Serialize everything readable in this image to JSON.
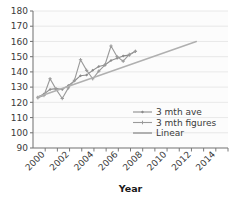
{
  "chart_data": {
    "type": "line",
    "title": "",
    "xlabel": "Year",
    "ylabel": "",
    "xlim": [
      1999,
      2015
    ],
    "ylim": [
      90,
      180
    ],
    "ytick_step": 10,
    "xtick_step": 2,
    "grid": true,
    "legend_position": "inside-right",
    "xticks": [
      "2000",
      "2002",
      "2004",
      "2006",
      "2008",
      "2010",
      "2012",
      "2014"
    ],
    "xtick_values": [
      2000,
      2002,
      2004,
      2006,
      2008,
      2010,
      2012,
      2014
    ],
    "yticks": [
      "90",
      "100",
      "110",
      "120",
      "130",
      "140",
      "150",
      "160",
      "170",
      "180"
    ],
    "ytick_values": [
      90,
      100,
      110,
      120,
      130,
      140,
      150,
      160,
      170,
      180
    ],
    "series": [
      {
        "name": "3 mth ave",
        "marker": "diamond",
        "color": "#8c8c8c",
        "x": [
          1999.4,
          1999.9,
          2000.4,
          2000.9,
          2001.4,
          2001.9,
          2002.4,
          2002.9,
          2003.4,
          2003.9,
          2004.4,
          2004.9,
          2005.4,
          2005.9,
          2006.4,
          2006.9,
          2007.4
        ],
        "values": [
          123.5,
          125.5,
          128.5,
          129.0,
          128.5,
          131.0,
          134.0,
          137.5,
          138.0,
          141.0,
          143.5,
          144.5,
          147.5,
          149.0,
          150.5,
          151.0,
          153.5
        ]
      },
      {
        "name": "3 mth figures",
        "marker": "cross",
        "color": "#9a9a9a",
        "x": [
          1999.4,
          1999.9,
          2000.4,
          2000.9,
          2001.4,
          2001.9,
          2002.4,
          2002.9,
          2003.4,
          2003.9,
          2004.4,
          2004.9,
          2005.4,
          2005.9,
          2006.4,
          2006.9,
          2007.4
        ],
        "values": [
          123.0,
          124.5,
          135.5,
          128.5,
          122.5,
          129.5,
          134.5,
          148.0,
          141.0,
          135.5,
          140.5,
          144.5,
          157.0,
          150.0,
          147.0,
          151.5,
          153.5
        ]
      },
      {
        "name": "Linear",
        "marker": "none",
        "color": "#b0b0b0",
        "x": [
          1999.4,
          2012.4
        ],
        "values": [
          123.5,
          160.0
        ]
      }
    ],
    "legend": [
      {
        "label": "3 mth ave",
        "marker": "diamond",
        "color": "#8c8c8c"
      },
      {
        "label": "3 mth figures",
        "marker": "cross",
        "color": "#9a9a9a"
      },
      {
        "label": "Linear",
        "marker": "none",
        "color": "#b0b0b0"
      }
    ],
    "colors": {
      "plot_background": "#fcfcfc",
      "grid": "#e3e3e3",
      "axis": "#7a7a7a",
      "text": "#3a3a3a",
      "page_background": "#ffffff"
    }
  }
}
